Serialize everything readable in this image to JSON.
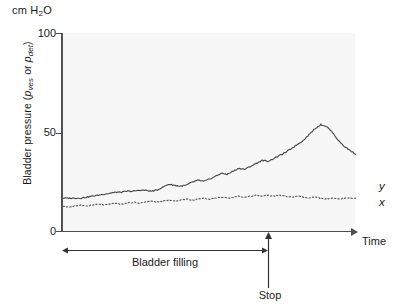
{
  "figure": {
    "unit_label_text": "cm H",
    "unit_label_sub": "2",
    "unit_label_tail": "O",
    "ylabel_prefix": "Bladder pressure (",
    "ylabel_p1": "p",
    "ylabel_sub1": "ves",
    "ylabel_mid": " or ",
    "ylabel_p2": "p",
    "ylabel_sub2": "det",
    "ylabel_suffix": ")",
    "xlabel": "Time",
    "series_label_upper": "y",
    "series_label_lower": "x",
    "filling_label": "Bladder filling",
    "stop_label": "Stop",
    "axis_color": "#4d4d4d",
    "plot_bg": "#f7f7f7",
    "curve_color": "#444444"
  },
  "chart_data": {
    "type": "line",
    "title": "",
    "xlabel": "Time",
    "ylabel": "Bladder pressure (p_ves or p_det)",
    "yunit": "cm H2O",
    "ylim": [
      0,
      100
    ],
    "yticks": [
      0,
      50,
      100
    ],
    "ytick_labels": [
      "0",
      "50",
      "100"
    ],
    "xlim": [
      0,
      100
    ],
    "xticks": [],
    "grid": false,
    "legend_position": "right-end-of-line",
    "annotations": [
      {
        "name": "bladder-filling-span",
        "label": "Bladder filling",
        "x_start": 0,
        "x_end": 70,
        "style": "double-headed-arrow"
      },
      {
        "name": "stop-marker",
        "label": "Stop",
        "x": 70,
        "style": "up-arrow"
      }
    ],
    "series": [
      {
        "name": "y",
        "label": "y",
        "style": "solid",
        "description": "Intravesical pressure p_ves: slow rise during filling, peak at void, then decline",
        "x": [
          0,
          2,
          4,
          6,
          8,
          10,
          12,
          14,
          16,
          18,
          20,
          22,
          24,
          26,
          28,
          30,
          32,
          34,
          36,
          38,
          40,
          42,
          44,
          46,
          48,
          50,
          52,
          54,
          56,
          58,
          60,
          62,
          64,
          66,
          68,
          70,
          72,
          74,
          76,
          78,
          80,
          82,
          84,
          86,
          88,
          90,
          92,
          94,
          96,
          98,
          100
        ],
        "y": [
          17,
          17,
          17,
          17,
          17.5,
          18,
          18.5,
          19,
          19.5,
          20,
          20,
          20.5,
          20.5,
          21,
          21,
          20.5,
          21,
          22.5,
          24,
          23.5,
          23,
          23.5,
          25,
          26,
          25.5,
          26.5,
          28,
          29.5,
          29,
          30.5,
          32,
          31.5,
          33,
          34.5,
          36,
          35.5,
          37,
          38.5,
          40,
          42,
          44,
          46,
          49,
          52,
          54,
          53,
          50,
          46,
          43,
          41,
          39
        ]
      },
      {
        "name": "x",
        "label": "x",
        "style": "dotted",
        "description": "Abdominal pressure p_abd: nearly flat baseline with small fluctuations",
        "x": [
          0,
          2,
          4,
          6,
          8,
          10,
          12,
          14,
          16,
          18,
          20,
          22,
          24,
          26,
          28,
          30,
          32,
          34,
          36,
          38,
          40,
          42,
          44,
          46,
          48,
          50,
          52,
          54,
          56,
          58,
          60,
          62,
          64,
          66,
          68,
          70,
          72,
          74,
          76,
          78,
          80,
          82,
          84,
          86,
          88,
          90,
          92,
          94,
          96,
          98,
          100
        ],
        "y": [
          13,
          12.5,
          13,
          13.5,
          13,
          13.5,
          14,
          13.5,
          14,
          14.5,
          14,
          14.5,
          15,
          14.5,
          15,
          15.5,
          15,
          15.5,
          16,
          15.5,
          16,
          16.5,
          16,
          16.5,
          17,
          16.5,
          17,
          17.5,
          17,
          17.5,
          18,
          17.5,
          18,
          18.5,
          18,
          18.5,
          18,
          18.5,
          18,
          17.5,
          18,
          17.5,
          17,
          17.5,
          17,
          16.5,
          17,
          16.5,
          17,
          17,
          17
        ]
      }
    ]
  }
}
